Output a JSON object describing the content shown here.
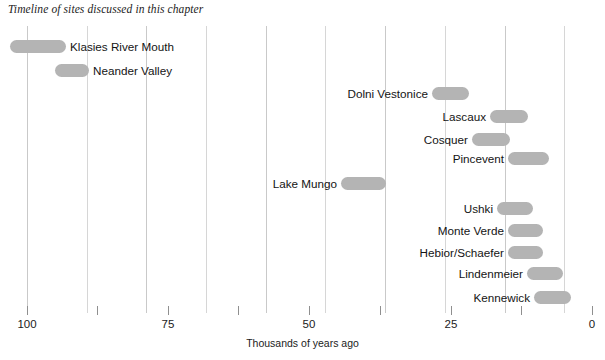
{
  "chart_data": {
    "type": "bar",
    "orientation": "horizontal-range",
    "title": "Timeline of sites discussed in this chapter",
    "xlabel": "Thousands of years ago",
    "ylabel": "",
    "xlim": [
      100,
      0
    ],
    "x_axis_reversed": true,
    "grid": true,
    "legend": false,
    "bar_color": "#b4b4b4",
    "gridline_color": "#c9c9c9",
    "tick_values": [
      100,
      75,
      50,
      25,
      0
    ],
    "tick_labels": [
      "100",
      "75",
      "50",
      "25",
      "0"
    ],
    "minor_tick_values": [
      87.5,
      62.5,
      37.5,
      12.5
    ],
    "gridline_values": [
      100,
      90,
      80,
      70,
      60,
      50,
      40,
      30,
      20,
      10
    ],
    "categories": [
      "Klasies River Mouth",
      "Neander Valley",
      "Dolni Vestonice",
      "Lascaux",
      "Cosquer",
      "Pincevent",
      "Lake Mungo",
      "Ushki",
      "Monte Verde",
      "Hebior/Schaefer",
      "Lindenmeier",
      "Kennewick"
    ],
    "ranges": [
      {
        "label": "Klasies River Mouth",
        "start": 103.0,
        "end": 94.5,
        "label_side": "right"
      },
      {
        "label": "Neander Valley",
        "start": 95.5,
        "end": 90.0,
        "label_side": "right"
      },
      {
        "label": "Dolni Vestonice",
        "start": 31.5,
        "end": 25.5,
        "label_side": "left"
      },
      {
        "label": "Lascaux",
        "start": 21.5,
        "end": 15.5,
        "label_side": "left"
      },
      {
        "label": "Cosquer",
        "start": 24.5,
        "end": 18.5,
        "label_side": "left"
      },
      {
        "label": "Pincevent",
        "start": 18.5,
        "end": 12.0,
        "label_side": "left"
      },
      {
        "label": "Lake Mungo",
        "start": 45.5,
        "end": 38.0,
        "label_side": "left"
      },
      {
        "label": "Ushki",
        "start": 18.0,
        "end": 12.5,
        "label_side": "left"
      },
      {
        "label": "Monte Verde",
        "start": 16.5,
        "end": 11.0,
        "label_side": "left"
      },
      {
        "label": "Hebior/Schaefer",
        "start": 16.5,
        "end": 11.0,
        "label_side": "left"
      },
      {
        "label": "Lindenmeier",
        "start": 13.5,
        "end": 7.5,
        "label_side": "left"
      },
      {
        "label": "Kennewick",
        "start": 12.5,
        "end": 6.5,
        "label_side": "left"
      }
    ]
  },
  "layout": {
    "rows": [
      {
        "name": "klasies-river-mouth",
        "y": 38,
        "bar_x": 10,
        "bar_w": 56,
        "label_x": 70,
        "side": "right"
      },
      {
        "name": "neander-valley",
        "y": 62,
        "bar_x": 55,
        "bar_w": 34,
        "label_x": 93,
        "side": "right"
      },
      {
        "name": "dolni-vestonice",
        "y": 85,
        "bar_x": 432,
        "bar_w": 37,
        "label_x": 428,
        "side": "left"
      },
      {
        "name": "lascaux",
        "y": 108,
        "bar_x": 490,
        "bar_w": 38,
        "label_x": 486,
        "side": "left"
      },
      {
        "name": "cosquer",
        "y": 131,
        "bar_x": 472,
        "bar_w": 38,
        "label_x": 468,
        "side": "left"
      },
      {
        "name": "pincevent",
        "y": 150,
        "bar_x": 508,
        "bar_w": 41,
        "label_x": 504,
        "side": "left"
      },
      {
        "name": "lake-mungo",
        "y": 175,
        "bar_x": 341,
        "bar_w": 45,
        "label_x": 337,
        "side": "left"
      },
      {
        "name": "ushki",
        "y": 200,
        "bar_x": 497,
        "bar_w": 36,
        "label_x": 493,
        "side": "left"
      },
      {
        "name": "monte-verde",
        "y": 222,
        "bar_x": 508,
        "bar_w": 35,
        "label_x": 504,
        "side": "left"
      },
      {
        "name": "hebior-schaefer",
        "y": 244,
        "bar_x": 508,
        "bar_w": 35,
        "label_x": 504,
        "side": "left"
      },
      {
        "name": "lindenmeier",
        "y": 265,
        "bar_x": 527,
        "bar_w": 36,
        "label_x": 523,
        "side": "left"
      },
      {
        "name": "kennewick",
        "y": 289,
        "bar_x": 534,
        "bar_w": 37,
        "label_x": 530,
        "side": "left"
      }
    ],
    "gridline_x": [
      27,
      87,
      146,
      206,
      266,
      325,
      385,
      445,
      505,
      564
    ],
    "tick_x": [
      27,
      168,
      309,
      451,
      592
    ],
    "minor_tick_x": [
      97,
      238,
      380,
      521
    ]
  }
}
